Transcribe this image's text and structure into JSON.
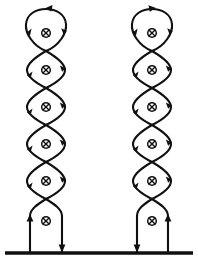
{
  "figure": {
    "background_color": "#ffffff",
    "stroke_color": "#101010",
    "width": 198,
    "height": 259,
    "symbol_name": "circled-cross-into-page",
    "symbol_glyph": "⊗",
    "symbol_meaning": "current into page",
    "baseline": {
      "name": "ground-line",
      "y": 253,
      "x_start": 5,
      "x_end": 193,
      "thickness": 3.4
    },
    "columns": [
      {
        "name": "left-chain",
        "center_x": 46,
        "half_width": 19,
        "loop_count": 6,
        "crossing_count": 6,
        "symbol_y_positions": [
          33,
          70,
          107,
          144,
          181,
          221
        ],
        "crossing_y_positions": [
          15,
          51,
          88,
          125,
          162,
          199
        ],
        "legs": [
          {
            "name": "left-leg",
            "x": 30,
            "y_top": 215,
            "y_bottom": 253,
            "arrow_direction": "up"
          },
          {
            "name": "right-leg",
            "x": 62,
            "y_top": 215,
            "y_bottom": 253,
            "arrow_direction": "down"
          }
        ],
        "top_cap": {
          "shape": "rounded-loop",
          "apex_y": 12,
          "arrow_direction": "left"
        }
      },
      {
        "name": "right-chain",
        "center_x": 152,
        "half_width": 19,
        "loop_count": 6,
        "crossing_count": 6,
        "symbol_y_positions": [
          33,
          70,
          107,
          144,
          181,
          221
        ],
        "crossing_y_positions": [
          15,
          51,
          88,
          125,
          162,
          199
        ],
        "legs": [
          {
            "name": "left-leg",
            "x": 137,
            "y_top": 215,
            "y_bottom": 253,
            "arrow_direction": "down"
          },
          {
            "name": "right-leg",
            "x": 168,
            "y_top": 215,
            "y_bottom": 253,
            "arrow_direction": "up"
          }
        ],
        "top_cap": {
          "shape": "rounded-loop",
          "apex_y": 12,
          "arrow_direction": "right"
        }
      }
    ]
  }
}
